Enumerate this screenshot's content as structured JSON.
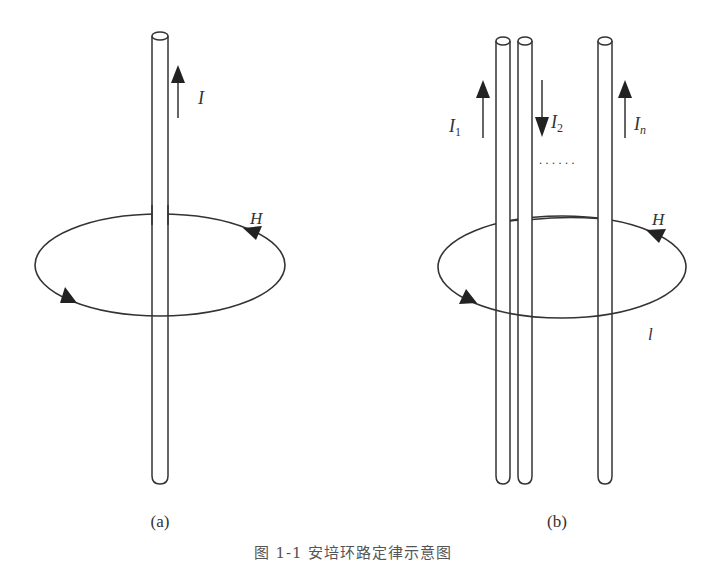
{
  "figure": {
    "caption": "图 1-1  安培环路定律示意图",
    "panels": [
      {
        "id": "a",
        "label": "(a)",
        "wires": [
          {
            "x": 160,
            "current_label": "I",
            "direction": "up"
          }
        ],
        "loop_label": "H"
      },
      {
        "id": "b",
        "label": "(b)",
        "wires": [
          {
            "x": 503,
            "current_label": "I",
            "subscript": "1",
            "direction": "up"
          },
          {
            "x": 525,
            "current_label": "I",
            "subscript": "2",
            "direction": "down"
          },
          {
            "x": 605,
            "current_label": "I",
            "subscript": "n",
            "direction": "up"
          }
        ],
        "ellipsis": "......",
        "loop_label": "H",
        "path_label": "l"
      }
    ],
    "colors": {
      "stroke": "#333333",
      "background": "#ffffff"
    }
  }
}
